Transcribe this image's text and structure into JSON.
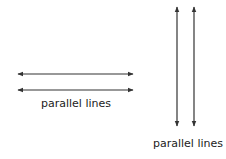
{
  "diagram": {
    "title": "",
    "line_color": "#333333",
    "groups": [
      {
        "name": "horizontal-parallel-lines",
        "label": "parallel lines",
        "lines": [
          {
            "x1": 18,
            "y1": 74,
            "x2": 133,
            "y2": 74
          },
          {
            "x1": 18,
            "y1": 90,
            "x2": 133,
            "y2": 90
          }
        ]
      },
      {
        "name": "vertical-parallel-lines",
        "label": "parallel lines",
        "lines": [
          {
            "x1": 177,
            "y1": 7,
            "x2": 177,
            "y2": 126
          },
          {
            "x1": 194,
            "y1": 7,
            "x2": 194,
            "y2": 126
          }
        ]
      }
    ]
  }
}
